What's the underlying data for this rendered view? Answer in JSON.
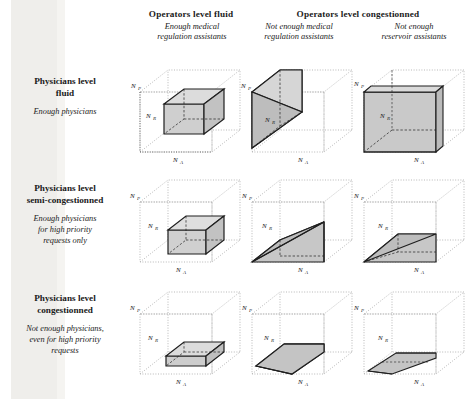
{
  "figure": {
    "columns": [
      {
        "id": "col-fluid",
        "group_title": "Operators level fluid",
        "subtitle": "Enough medical\nregulation assistants",
        "subtitle_line1": "Enough medical",
        "subtitle_line2": "regulation assistants"
      },
      {
        "id": "col-congested-medical",
        "group_title": "Operators level congestionned",
        "subtitle_line1": "Not enough medical",
        "subtitle_line2": "regulation assistants"
      },
      {
        "id": "col-congested-reservoir",
        "group_title": "",
        "subtitle_line1": "Not enough",
        "subtitle_line2": "reservoir assistants"
      }
    ],
    "group_headers": [
      {
        "id": "hdr-fluid",
        "label": "Operators level fluid"
      },
      {
        "id": "hdr-congestionned",
        "label": "Operators level congestionned"
      }
    ],
    "rows": [
      {
        "id": "row-fluid",
        "title_line1": "Physicians level",
        "title_line2": "fluid",
        "sub_line1": "Enough physicians",
        "sub_line2": "",
        "sub_line3": ""
      },
      {
        "id": "row-semi",
        "title_line1": "Physicians level",
        "title_line2": "semi-congestionned",
        "sub_line1": "Enough physicians",
        "sub_line2": "for high priority",
        "sub_line3": "requests only"
      },
      {
        "id": "row-congested",
        "title_line1": "Physicians level",
        "title_line2": "congestionned",
        "sub_line1": "Not enough physicians,",
        "sub_line2": "even for high priority",
        "sub_line3": "requests"
      }
    ],
    "axes": {
      "vertical": "N",
      "vertical_sub": "P",
      "depth": "N",
      "depth_sub": "R",
      "horizontal": "N",
      "horizontal_sub": "A"
    },
    "colors": {
      "ink": "#1a1a1a",
      "solid_fill": "#c9c9c9",
      "solid_fill_dark": "#b8b8b8",
      "solid_fill_light": "#d8d8d8",
      "outer_dotted": "#9a9a9a",
      "paper": "#ffffff",
      "scan_band": "#e9e8e4"
    },
    "cells": [
      {
        "id": "cell-r1c1",
        "row": "row-fluid",
        "col": "col-fluid",
        "shape": "box",
        "description": "medium rectangular box in upper-rear region of the cube"
      },
      {
        "id": "cell-r1c2",
        "row": "row-fluid",
        "col": "col-congested-medical",
        "shape": "wedge",
        "description": "tall grey wedge filling the left half, sloping down to the front-left corner"
      },
      {
        "id": "cell-r1c3",
        "row": "row-fluid",
        "col": "col-congested-reservoir",
        "shape": "slab",
        "description": "full-height thin slab across the front face"
      },
      {
        "id": "cell-r2c1",
        "row": "row-semi",
        "col": "col-fluid",
        "shape": "box",
        "description": "smaller rectangular box sitting lower in the cube"
      },
      {
        "id": "cell-r2c2",
        "row": "row-semi",
        "col": "col-congested-medical",
        "shape": "wedge",
        "description": "low grey wedge sloping from front-left corner up to the right"
      },
      {
        "id": "cell-r2c3",
        "row": "row-semi",
        "col": "col-congested-reservoir",
        "shape": "wedge",
        "description": "flat low wedge resting on the base of the cube"
      },
      {
        "id": "cell-r3c1",
        "row": "row-congested",
        "col": "col-fluid",
        "shape": "slab",
        "description": "thin flat slab lying on the cube floor"
      },
      {
        "id": "cell-r3c2",
        "row": "row-congested",
        "col": "col-congested-medical",
        "shape": "slab",
        "description": "very thin grey sheet lying on the cube floor"
      },
      {
        "id": "cell-r3c3",
        "row": "row-congested",
        "col": "col-congested-reservoir",
        "shape": "sliver",
        "description": "extremely thin sliver on the cube floor"
      }
    ]
  }
}
